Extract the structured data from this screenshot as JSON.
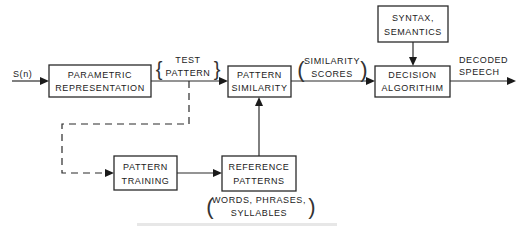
{
  "diagram": {
    "input_label": "S(n)",
    "blocks": {
      "parametric": [
        "PARAMETRIC",
        "REPRESENTATION"
      ],
      "similarity": [
        "PATTERN",
        "SIMILARITY"
      ],
      "decision": [
        "DECISION",
        "ALGORITHIM"
      ],
      "syntax": [
        "SYNTAX,",
        "SEMANTICS"
      ],
      "training": [
        "PATTERN",
        "TRAINING"
      ],
      "reference": [
        "REFERENCE",
        "PATTERNS"
      ]
    },
    "annotations": {
      "test_pattern": [
        "TEST",
        "PATTERN"
      ],
      "similarity_scores": [
        "SIMILARITY",
        "SCORES"
      ],
      "decoded_speech": [
        "DECODED",
        "SPEECH"
      ],
      "reference_units": [
        "WORDS, PHRASES,",
        "SYLLABLES"
      ]
    },
    "edges": [
      {
        "from": "input",
        "to": "parametric",
        "style": "solid"
      },
      {
        "from": "parametric",
        "to": "similarity",
        "style": "solid",
        "label": "test_pattern"
      },
      {
        "from": "similarity",
        "to": "decision",
        "style": "solid",
        "label": "similarity_scores"
      },
      {
        "from": "syntax",
        "to": "decision",
        "style": "solid"
      },
      {
        "from": "decision",
        "to": "output",
        "style": "solid",
        "label": "decoded_speech"
      },
      {
        "from": "parametric",
        "to": "training",
        "style": "dashed"
      },
      {
        "from": "training",
        "to": "reference",
        "style": "solid"
      },
      {
        "from": "reference",
        "to": "similarity",
        "style": "solid"
      }
    ]
  }
}
